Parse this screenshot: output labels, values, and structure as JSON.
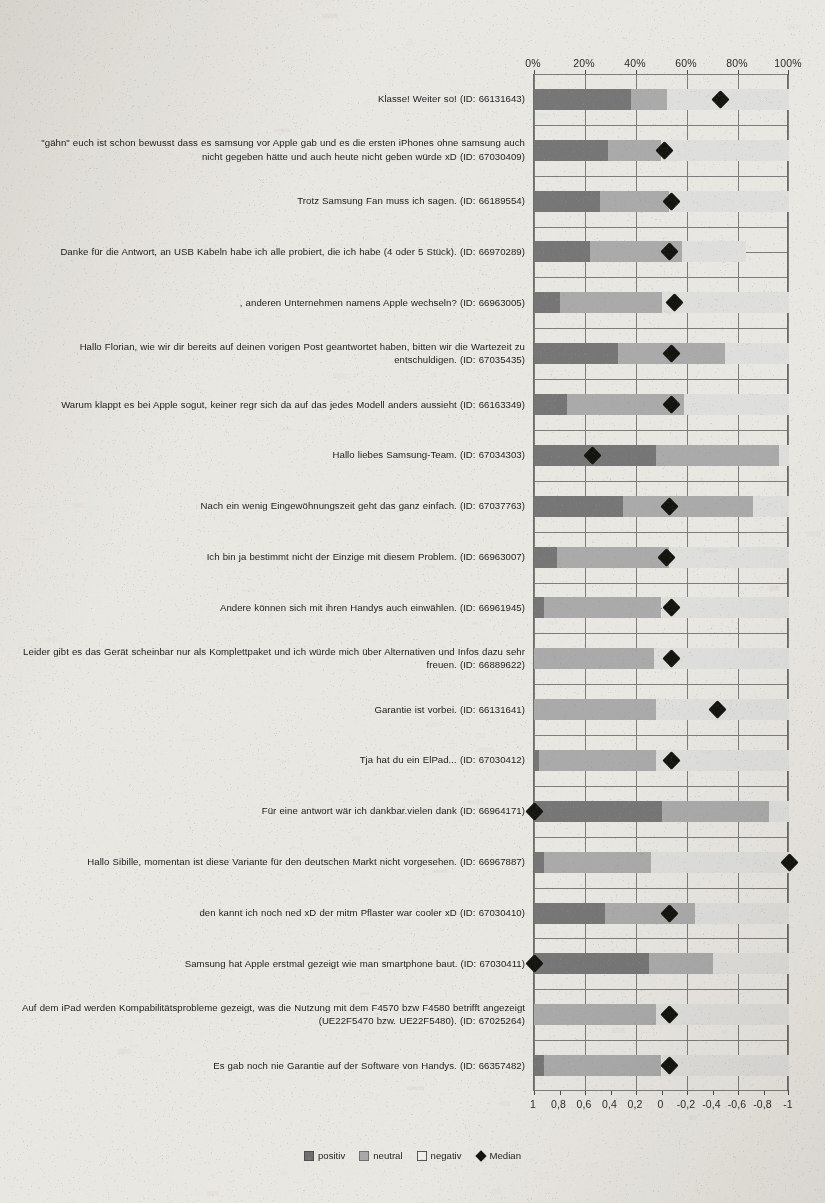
{
  "chart_data": {
    "type": "bar",
    "subtype": "diverging-stacked-bar-with-median",
    "title": "",
    "xlabel": "",
    "ylabel": "",
    "grid": true,
    "legend_position": "bottom",
    "axis_top": {
      "label": "percent",
      "ticks": [
        "0%",
        "20%",
        "40%",
        "60%",
        "80%",
        "100%"
      ],
      "range": [
        0,
        100
      ]
    },
    "axis_bottom": {
      "label": "sentiment",
      "ticks": [
        "1",
        "0,8",
        "0,6",
        "0,4",
        "0,2",
        "0",
        "-0,2",
        "-0,4",
        "-0,6",
        "-0,8",
        "-1"
      ],
      "range": [
        1,
        -1
      ]
    },
    "series_names": [
      "positiv",
      "neutral",
      "negativ"
    ],
    "median_name": "Median",
    "colors": {
      "positiv": "#767676",
      "neutral": "#aaaaaa",
      "negativ": "#dededc",
      "median": "#15150f",
      "background": "#e9e7e2",
      "gridline": "#7c7c7c"
    },
    "categories": [
      "Klasse! Weiter so! (ID: 66131643)",
      "\"gähn\" euch ist schon bewusst dass es samsung vor Apple gab und es die ersten iPhones ohne samsung auch nicht gegeben hätte und auch heute nicht geben würde xD (ID: 67030409)",
      "Trotz Samsung Fan muss ich sagen. (ID: 66189554)",
      "Danke für die Antwort, an USB Kabeln habe ich alle probiert, die ich habe (4 oder 5 Stück). (ID: 66970289)",
      ", anderen Unternehmen namens Apple wechseln? (ID: 66963005)",
      "Hallo Florian, wie wir dir bereits auf deinen vorigen Post geantwortet haben, bitten wir die Wartezeit zu entschuldigen. (ID: 67035435)",
      "Warum klappt es bei Apple sogut, keiner regr sich da auf das jedes Modell anders aussieht (ID: 66163349)",
      "Hallo liebes Samsung-Team. (ID: 67034303)",
      "Nach ein wenig Eingewöhnungszeit geht das ganz einfach. (ID: 67037763)",
      "Ich bin ja bestimmt nicht der Einzige mit diesem Problem. (ID: 66963007)",
      "Andere können sich mit ihren Handys auch einwählen. (ID: 66961945)",
      "Leider gibt es das Gerät scheinbar nur als Komplettpaket und ich würde mich über Alternativen und Infos dazu sehr freuen. (ID: 66889622)",
      "Garantie ist vorbei. (ID: 66131641)",
      "Tja hat du ein ElPad... (ID: 67030412)",
      "Für eine antwort wär ich dankbar.vielen dank (ID: 66964171)",
      "Hallo Sibille, momentan ist diese Variante für den deutschen Markt nicht vorgesehen. (ID: 66967887)",
      "den kannt ich noch ned xD  der mitm Pflaster war cooler xD (ID: 67030410)",
      "Samsung hat Apple erstmal gezeigt wie man smartphone baut. (ID: 67030411)",
      "Auf dem iPad werden Kompabilitätsprobleme gezeigt, was die Nutzung mit dem F4570 bzw F4580 betrifft angezeigt (UE22F5470 bzw. UE22F5480). (ID: 67025264)",
      "Es gab noch nie Garantie auf der Software von Handys. (ID: 66357482)"
    ],
    "series": [
      {
        "name": "positiv",
        "values": [
          38,
          29,
          26,
          22,
          10,
          33,
          13,
          48,
          35,
          9,
          4,
          0,
          0,
          2,
          50,
          4,
          28,
          45,
          0,
          4
        ]
      },
      {
        "name": "neutral",
        "values": [
          14,
          21,
          27,
          36,
          40,
          42,
          46,
          48,
          51,
          44,
          46,
          47,
          48,
          46,
          42,
          42,
          35,
          25,
          48,
          46
        ]
      },
      {
        "name": "negativ",
        "values": [
          48,
          50,
          47,
          25,
          50,
          25,
          41,
          4,
          14,
          47,
          50,
          53,
          52,
          52,
          8,
          54,
          37,
          30,
          52,
          50
        ]
      }
    ],
    "median_percent": [
      73,
      51,
      54,
      53,
      55,
      54,
      54,
      23,
      53,
      52,
      54,
      54,
      72,
      54,
      0,
      100,
      53,
      0,
      53,
      53
    ],
    "median_values": [
      -0.46,
      -0.02,
      -0.08,
      -0.06,
      -0.1,
      -0.08,
      -0.08,
      0.54,
      -0.06,
      -0.04,
      -0.08,
      -0.08,
      -0.44,
      -0.08,
      1.0,
      -1.0,
      -0.06,
      1.0,
      -0.06,
      -0.06
    ]
  },
  "legend": {
    "positiv": "positiv",
    "neutral": "neutral",
    "negativ": "negativ",
    "median": "Median"
  }
}
